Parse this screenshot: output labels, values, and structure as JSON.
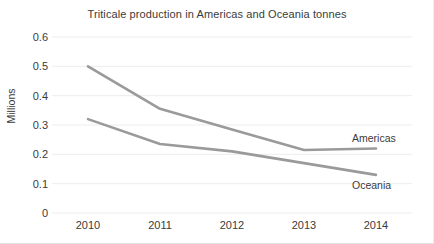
{
  "chart_data": {
    "type": "line",
    "title": "Triticale production in Americas and Oceania tonnes",
    "xlabel": "",
    "ylabel": "Millions",
    "categories": [
      "2010",
      "2011",
      "2012",
      "2013",
      "2014"
    ],
    "series": [
      {
        "name": "Americas",
        "color": "#9a9a9a",
        "values": [
          0.5,
          0.355,
          0.285,
          0.215,
          0.22
        ]
      },
      {
        "name": "Oceania",
        "color": "#9a9a9a",
        "values": [
          0.32,
          0.235,
          0.21,
          0.17,
          0.13
        ]
      }
    ],
    "ylim": [
      0,
      0.6
    ],
    "yticks": [
      "0",
      "0.1",
      "0.2",
      "0.3",
      "0.4",
      "0.5",
      "0.6"
    ],
    "ytick_values": [
      0,
      0.1,
      0.2,
      0.3,
      0.4,
      0.5,
      0.6
    ],
    "grid": true,
    "grid_color": "#ededed",
    "legend_position": "inline-right",
    "background": "#ffffff",
    "text_color": "#3b3b3b"
  }
}
